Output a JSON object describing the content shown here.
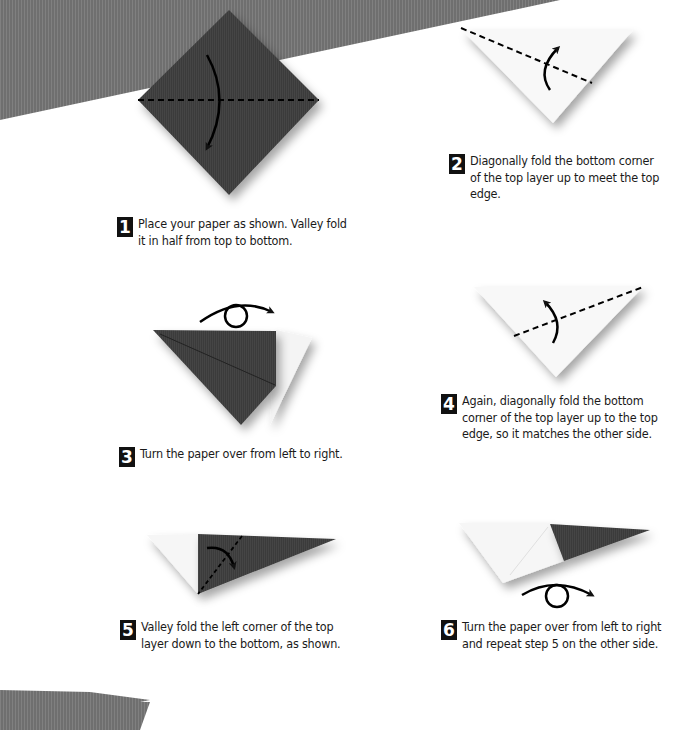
{
  "document": {
    "type": "origami instructions",
    "colors": {
      "paper_dark": "#3a3a3a",
      "paper_light": "#f7f7f7",
      "background_band": "#777777",
      "text": "#1a1a1a"
    }
  },
  "steps": [
    {
      "number": "1",
      "text": "Place your paper as shown. Valley fold it in half from top to bottom.",
      "diagram": "dark square diamond with horizontal dashed valley fold and downward curved arrow"
    },
    {
      "number": "2",
      "text": "Diagonally fold the bottom corner of the top layer up to meet the top edge.",
      "diagram": "white triangle with diagonal dashed fold line and upward curved arrow"
    },
    {
      "number": "3",
      "text": "Turn the paper over from left to right.",
      "diagram": "dark triangle with flap, turn-over arrow above"
    },
    {
      "number": "4",
      "text": "Again, diagonally fold the bottom corner of the top layer up to the top edge, so it matches the other side.",
      "diagram": "white triangle with diagonal dashed fold line and upward curved arrow"
    },
    {
      "number": "5",
      "text": "Valley fold the left corner of the top layer down to the bottom, as shown.",
      "diagram": "white and dark narrow shape with dashed fold and curved arrow"
    },
    {
      "number": "6",
      "text": "Turn the paper over from left to right and repeat step 5 on the other side.",
      "diagram": "white and dark narrow shape with turn-over arrow below"
    }
  ],
  "icons": {
    "valley_fold": "dashed-line",
    "fold_arrow": "curved-arrow",
    "turn_over": "loop-arrow"
  }
}
